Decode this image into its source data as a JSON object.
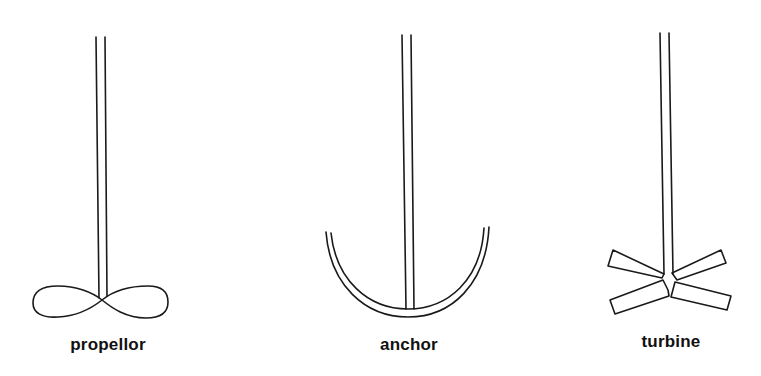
{
  "figure": {
    "type": "impeller-types",
    "line_color": "#1a1a1a",
    "background": "#ffffff"
  },
  "impellers": [
    {
      "id": "propellor",
      "label": "propellor",
      "label_x": 108,
      "label_y": 335
    },
    {
      "id": "anchor",
      "label": "anchor",
      "label_x": 409,
      "label_y": 335
    },
    {
      "id": "turbine",
      "label": "turbine",
      "label_x": 671,
      "label_y": 332
    }
  ]
}
